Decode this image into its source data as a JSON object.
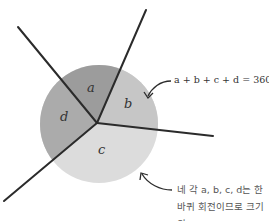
{
  "diagram": {
    "regions": [
      {
        "label": "a",
        "color": "#9a9a9a"
      },
      {
        "label": "b",
        "color": "#c4c4c4"
      },
      {
        "label": "c",
        "color": "#dcdcdc"
      },
      {
        "label": "d",
        "color": "#a8a8a8"
      }
    ],
    "equation": "a + b + c + d = 360°",
    "note_lines": [
      "네 각 a, b, c, d는 한",
      "바퀴 회전이므로 크기의",
      "합은 360°이다."
    ],
    "line_color": "#2b2b2b"
  }
}
